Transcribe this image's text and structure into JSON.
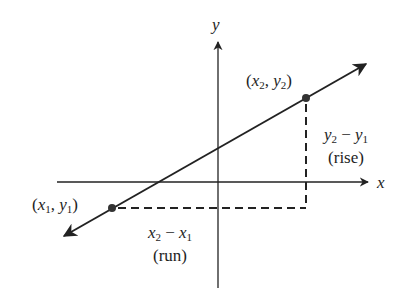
{
  "diagram": {
    "axes": {
      "x_label": "x",
      "y_label": "y"
    },
    "points": [
      {
        "id": "p1",
        "label_x": "x",
        "label_x_sub": "1",
        "label_y": "y",
        "label_y_sub": "1"
      },
      {
        "id": "p2",
        "label_x": "x",
        "label_x_sub": "2",
        "label_y": "y",
        "label_y_sub": "2"
      }
    ],
    "rise": {
      "expr_a": "y",
      "expr_a_sub": "2",
      "op": " − ",
      "expr_b": "y",
      "expr_b_sub": "1",
      "caption": "(rise)"
    },
    "run": {
      "expr_a": "x",
      "expr_a_sub": "2",
      "op": " − ",
      "expr_b": "x",
      "expr_b_sub": "1",
      "caption": "(run)"
    },
    "colors": {
      "ink": "#222222",
      "background": "#ffffff"
    }
  }
}
